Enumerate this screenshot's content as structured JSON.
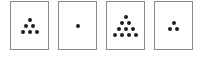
{
  "figure": {
    "cards": [
      {
        "index": 1,
        "dot_count": 6,
        "rows": [
          1,
          2,
          3
        ],
        "x": 10
      },
      {
        "index": 2,
        "dot_count": 1,
        "rows": [
          1
        ],
        "x": 58
      },
      {
        "index": 3,
        "dot_count": 10,
        "rows": [
          1,
          2,
          3,
          4
        ],
        "x": 106
      },
      {
        "index": 4,
        "dot_count": 3,
        "rows": [
          1,
          2
        ],
        "x": 154
      }
    ],
    "colors": {
      "border": "#8a8a8a",
      "dot": "#1e1e1e",
      "background": "#ffffff"
    }
  }
}
